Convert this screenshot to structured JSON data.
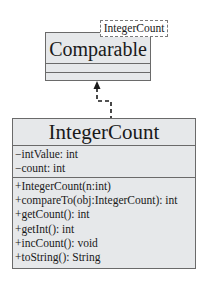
{
  "diagram": {
    "type": "uml-class-diagram",
    "interface": {
      "name": "Comparable",
      "template_parameter": "IntegerCount",
      "attributes": [],
      "methods": []
    },
    "class": {
      "name": "IntegerCount",
      "attributes": [
        "−intValue: int",
        "−count: int"
      ],
      "methods": [
        "+IntegerCount(n:int)",
        "+compareTo(obj:IntegerCount): int",
        "+getCount(): int",
        "+getInt(): int",
        "+incCount(): void",
        "+toString(): String"
      ]
    },
    "relationship": {
      "type": "realization",
      "from": "IntegerCount",
      "to": "Comparable",
      "line_style": "dashed",
      "arrowhead": "filled-triangle"
    },
    "colors": {
      "class_fill": "#e6e8ea",
      "border": "#6a6a6a",
      "text": "#1a1a1a",
      "background": "#ffffff"
    }
  }
}
